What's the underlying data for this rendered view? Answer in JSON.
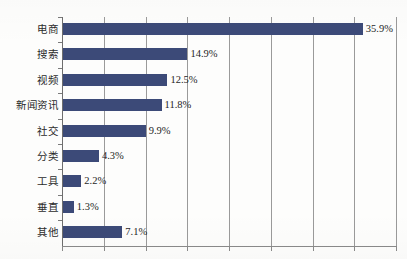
{
  "chart_data": {
    "type": "bar",
    "orientation": "horizontal",
    "title": "",
    "subtitle": "",
    "xlabel": "",
    "ylabel": "",
    "categories": [
      "电商",
      "搜索",
      "视频",
      "新闻资讯",
      "社交",
      "分类",
      "工具",
      "垂直",
      "其他"
    ],
    "values": [
      35.9,
      14.9,
      12.5,
      11.8,
      9.9,
      4.3,
      2.2,
      1.3,
      7.1
    ],
    "value_labels": [
      "35.9%",
      "14.9%",
      "12.5%",
      "11.8%",
      "9.9%",
      "4.3%",
      "2.2%",
      "1.3%",
      "7.1%"
    ],
    "xlim": [
      0,
      40
    ],
    "gridline_values": [
      0,
      5,
      10,
      15,
      20,
      25,
      30,
      35,
      40
    ],
    "tick_labels": [],
    "grid": true,
    "legend": false,
    "legend_position": "none",
    "series": [
      {
        "name": "占比",
        "values": [
          35.9,
          14.9,
          12.5,
          11.8,
          9.9,
          4.3,
          2.2,
          1.3,
          7.1
        ],
        "color": "#3c4a78"
      }
    ]
  },
  "style": {
    "bar_color": "#3c4a78",
    "gridline_color": "#9a9a9a",
    "axis_color": "#6e6e6e",
    "label_color": "#2b2b2b",
    "value_color": "#1f1f1f",
    "background": "#fdfdfc"
  }
}
